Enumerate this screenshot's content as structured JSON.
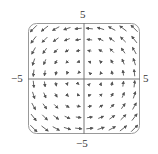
{
  "chart_data": {
    "type": "vector_field",
    "title": "",
    "field": "F(x, y) = <-y, x>",
    "xlim": [
      -5,
      5
    ],
    "ylim": [
      -5,
      5
    ],
    "grid_x": [
      -4.5,
      -3.5,
      -2.5,
      -1.5,
      -0.5,
      0.5,
      1.5,
      2.5,
      3.5,
      4.5
    ],
    "grid_y": [
      -4.5,
      -3.5,
      -2.5,
      -1.5,
      -0.5,
      0.5,
      1.5,
      2.5,
      3.5,
      4.5
    ],
    "arrow_scale": 0.13,
    "axes": {
      "x_label_min": "−5",
      "x_label_max": "5",
      "y_label_min": "−5",
      "y_label_max": "5"
    },
    "frame": "rounded square",
    "grid": false,
    "colors": {
      "arrow": "#555555",
      "axis": "#777777",
      "frame": "#999999"
    }
  },
  "labels": {
    "top": "5",
    "bottom": "−5",
    "left": "−5",
    "right": "5"
  }
}
